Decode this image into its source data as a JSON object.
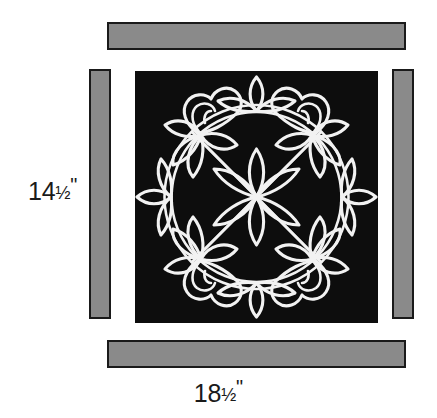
{
  "diagram": {
    "background_color": "#ffffff",
    "block": {
      "name": "appliqued-floral-block",
      "fill_color": "#0d0d0d",
      "motif_color": "#f2f2f2",
      "motif_description": "Symmetrical floral appliqué wreath: four corner roses, four trefoil florets at the edge midpoints, a six-petal flower at the center, joined by a circular vine ring and diagonal stems"
    },
    "strips": [
      {
        "name": "top-border-strip",
        "position": "top",
        "fill_color": "#8a8a8a",
        "outline_color": "#1a1a1a"
      },
      {
        "name": "right-border-strip",
        "position": "right",
        "fill_color": "#8a8a8a",
        "outline_color": "#1a1a1a"
      },
      {
        "name": "bottom-border-strip",
        "position": "bottom",
        "fill_color": "#8a8a8a",
        "outline_color": "#1a1a1a"
      },
      {
        "name": "left-border-strip",
        "position": "left",
        "fill_color": "#8a8a8a",
        "outline_color": "#1a1a1a"
      }
    ],
    "dimensions": {
      "height": {
        "whole": "14",
        "fraction": "1/2",
        "unit": "\"",
        "full_text": "14½\""
      },
      "width": {
        "whole": "18",
        "fraction": "1/2",
        "unit": "\"",
        "full_text": "18½\""
      }
    }
  }
}
